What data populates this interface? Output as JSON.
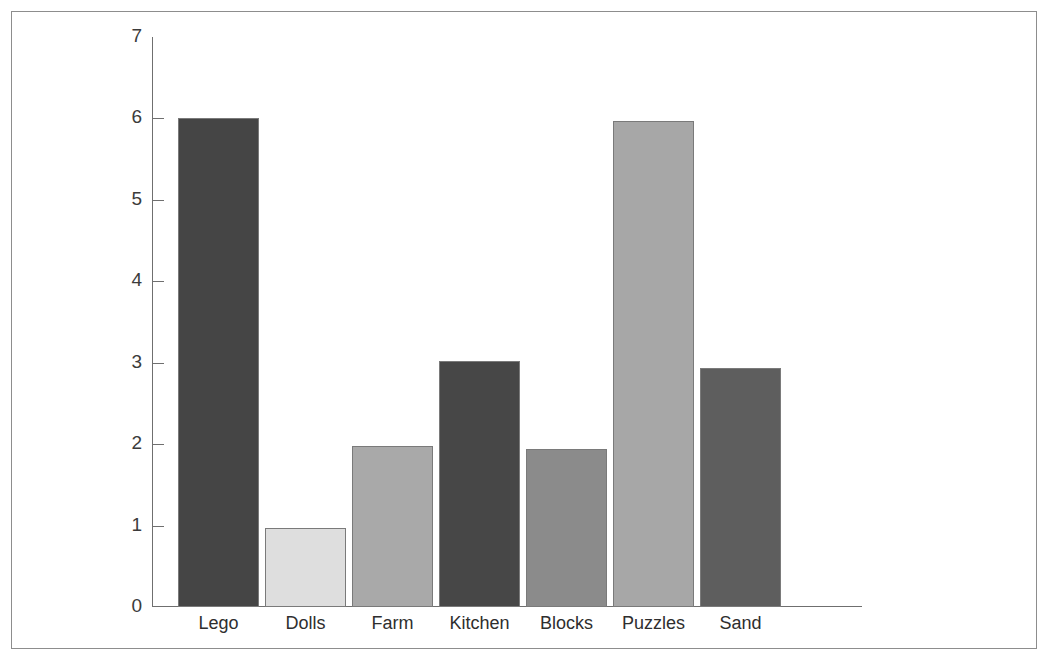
{
  "chart_data": {
    "type": "bar",
    "title": "",
    "subtitle": "",
    "xlabel": "",
    "ylabel": "",
    "categories": [
      "Lego",
      "Dolls",
      "Farm",
      "Kitchen",
      "Blocks",
      "Puzzles",
      "Sand"
    ],
    "values": [
      6,
      0.97,
      1.98,
      3.02,
      1.94,
      5.97,
      2.93
    ],
    "ylim": [
      0,
      7
    ],
    "ytick_labels": [
      "0",
      "1",
      "2",
      "3",
      "4",
      "5",
      "6",
      "7"
    ],
    "ytick_values": [
      0,
      1,
      2,
      3,
      4,
      5,
      6,
      7
    ],
    "grid": false,
    "legend": false,
    "legend_position": "none",
    "bar_colors": [
      "#454545",
      "#dedede",
      "#a9a9a9",
      "#474747",
      "#8b8b8b",
      "#a7a7a7",
      "#5e5e5e"
    ],
    "bar_border_color": "#7a7a7a",
    "axis_color": "#6f6f6f",
    "frame_color": "#8d8d8d",
    "background_color": "#ffffff"
  },
  "axes": {
    "y_axis_name": "y-axis",
    "x_axis_name": "x-axis"
  }
}
